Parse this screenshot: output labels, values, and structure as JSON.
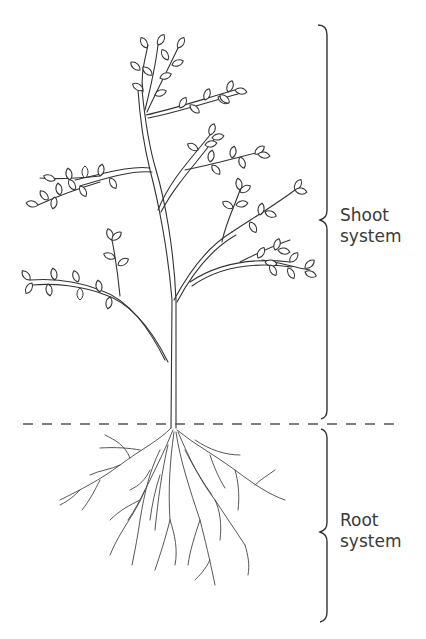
{
  "diagram": {
    "type": "plant-structure",
    "labels": {
      "shoot": {
        "line1": "Shoot",
        "line2": "system"
      },
      "root": {
        "line1": "Root",
        "line2": "system"
      }
    },
    "ground_line": {
      "style": "dashed",
      "y": 424
    },
    "colors": {
      "line": "#333333",
      "text": "#3a3a3a",
      "background": "#ffffff"
    }
  }
}
